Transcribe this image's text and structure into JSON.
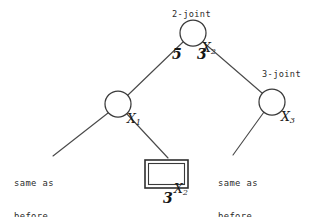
{
  "diagram": {
    "type": "decision-tree",
    "background_color": "#ffffff",
    "stroke_color": "#3a3a3a",
    "text_color": "#1a1a1a",
    "annotations": {
      "root_joint": "2-joint",
      "right_joint": "3-joint"
    },
    "nodes": [
      {
        "id": "root",
        "shape": "circle",
        "var": "X",
        "subscript": "2",
        "label": "X2",
        "annotation": "2-joint",
        "cx": 193,
        "cy": 33,
        "r": 13
      },
      {
        "id": "left",
        "shape": "circle",
        "var": "X",
        "subscript": "1",
        "label": "X1",
        "annotation": "",
        "cx": 118,
        "cy": 104,
        "r": 13
      },
      {
        "id": "right",
        "shape": "circle",
        "var": "X",
        "subscript": "3",
        "label": "X3",
        "annotation": "3-joint",
        "cx": 272,
        "cy": 102,
        "r": 13
      },
      {
        "id": "boxed",
        "shape": "double-box",
        "var": "X",
        "subscript": "2",
        "label": "X2",
        "annotation": "",
        "x": 145,
        "y": 160,
        "w": 43,
        "h": 28
      }
    ],
    "edges": [
      {
        "id": "root-left",
        "from": "root",
        "to": "left",
        "weight": "5"
      },
      {
        "id": "root-right",
        "from": "root",
        "to": "right",
        "weight": "3"
      },
      {
        "id": "left-leaf",
        "from": "left",
        "to": "leaf-left",
        "weight": ""
      },
      {
        "id": "left-boxed",
        "from": "left",
        "to": "boxed",
        "weight": ""
      },
      {
        "id": "right-leaf",
        "from": "right",
        "to": "leaf-right",
        "weight": ""
      }
    ],
    "edge_weights": [
      {
        "id": "w-left",
        "value": "5",
        "x": 172,
        "y": 46
      },
      {
        "id": "w-right",
        "value": "3",
        "x": 197,
        "y": 46
      }
    ],
    "box_weight": {
      "id": "w-box",
      "value": "3",
      "x": 163,
      "y": 190
    },
    "leaf_texts": [
      {
        "id": "leaf-left",
        "line1": "same as",
        "line2": "before",
        "x": 14,
        "y": 157
      },
      {
        "id": "leaf-right",
        "line1": "same as",
        "line2": "before",
        "x": 218,
        "y": 157
      }
    ]
  }
}
